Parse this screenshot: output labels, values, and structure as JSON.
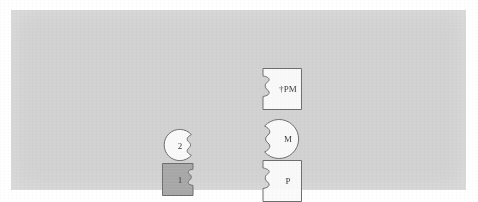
{
  "figure": {
    "background_color": "#ffffff",
    "panel_color": "#d3d3d3",
    "outline_color": "#6f6f6f",
    "shape_fill_white": "#fbfbfb",
    "shape_fill_gray": "#a9a9a9"
  },
  "nodes": {
    "ppm": {
      "label": "†PM",
      "shape": "notched-square",
      "notch_side": "left",
      "fill": "white"
    },
    "m": {
      "label": "M",
      "shape": "notched-circle",
      "notch_side": "left",
      "fill": "white"
    },
    "p": {
      "label": "P",
      "shape": "notched-square",
      "notch_side": "left",
      "fill": "white"
    },
    "two": {
      "label": "2",
      "shape": "notched-circle",
      "notch_side": "right",
      "fill": "white"
    },
    "one": {
      "label": "1",
      "shape": "notched-square",
      "notch_side": "right",
      "fill": "gray"
    }
  }
}
